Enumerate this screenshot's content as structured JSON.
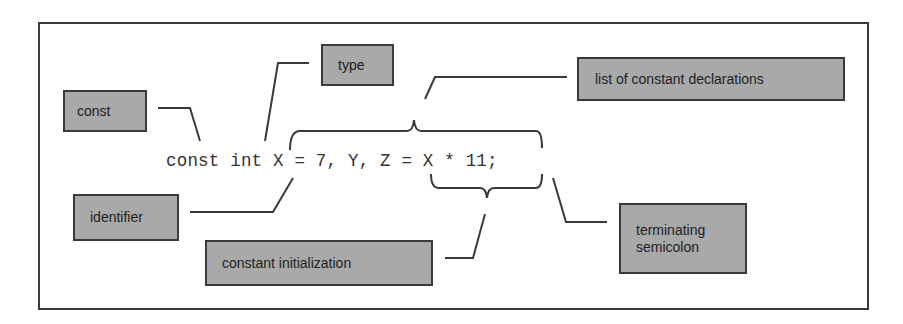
{
  "diagram": {
    "code_line": "const int X = 7, Y, Z = X * 11;",
    "labels": {
      "const": "const",
      "type": "type",
      "list": "list of constant declarations",
      "identifier": "identifier",
      "initialization": "constant initialization",
      "terminating_line1": "terminating",
      "terminating_line2": "semicolon"
    },
    "colors": {
      "box_fill": "#a9a9a9",
      "border": "#3a3a3a",
      "background": "#ffffff"
    }
  }
}
